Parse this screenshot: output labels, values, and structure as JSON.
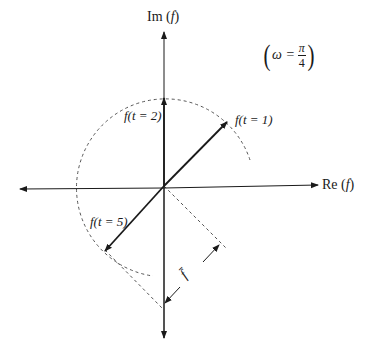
{
  "diagram": {
    "axes": {
      "vertical_label_prefix": "Im (",
      "vertical_label_var": "f",
      "vertical_label_suffix": ")",
      "horizontal_label_prefix": "Re (",
      "horizontal_label_var": "f",
      "horizontal_label_suffix": ")"
    },
    "parameter": {
      "symbol": "ω =",
      "numerator": "π",
      "denominator": "4",
      "open_paren": "(",
      "close_paren": ")"
    },
    "vectors": [
      {
        "label": "f(t = 1)",
        "angle_deg": 45
      },
      {
        "label": "f(t = 2)",
        "angle_deg": 90
      },
      {
        "label": "f(t = 5)",
        "angle_deg": 225
      }
    ],
    "dimension_label": "f̄",
    "colors": {
      "line": "#1a1a1a",
      "dash": "#555555",
      "background": "#ffffff"
    }
  }
}
